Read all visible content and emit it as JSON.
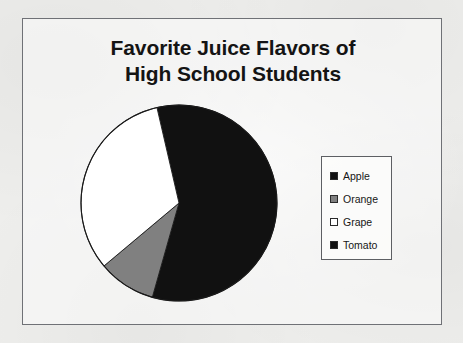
{
  "chart_data": {
    "type": "pie",
    "title": "Favorite Juice Flavors of High School Students",
    "title_lines": [
      "Favorite Juice Flavors of",
      "High School Students"
    ],
    "categories": [
      "Apple",
      "Orange",
      "Grape",
      "Tomato"
    ],
    "values": [
      58,
      9.5,
      32.5,
      0
    ],
    "unit": "percent",
    "colors": [
      "#111111",
      "#808080",
      "#ffffff",
      "#111111"
    ],
    "legend_position": "right",
    "grid": false,
    "xlabel": "",
    "ylabel": "",
    "slices": [
      {
        "label": "Apple",
        "value": 58,
        "color": "#111111",
        "start_deg": -13,
        "end_deg": 195.8,
        "swatch": "black-swatch"
      },
      {
        "label": "Orange",
        "value": 9.5,
        "color": "#808080",
        "start_deg": 195.8,
        "end_deg": 230,
        "swatch": "gray-swatch"
      },
      {
        "label": "Grape",
        "value": 32.5,
        "color": "#ffffff",
        "start_deg": 230,
        "end_deg": 347,
        "swatch": "white-swatch"
      },
      {
        "label": "Tomato",
        "value": 0,
        "color": "#111111",
        "start_deg": 347,
        "end_deg": 347,
        "swatch": "black-swatch"
      }
    ]
  },
  "chart": {
    "title_line1": "Favorite Juice Flavors of",
    "title_line2": "High School Students",
    "outline_color": "#6f7176",
    "pie_outline_color": "#1a1a1a"
  },
  "legend": {
    "items": [
      {
        "label": "Apple",
        "color": "#111111"
      },
      {
        "label": "Orange",
        "color": "#808080"
      },
      {
        "label": "Grape",
        "color": "#ffffff"
      },
      {
        "label": "Tomato",
        "color": "#111111"
      }
    ]
  }
}
